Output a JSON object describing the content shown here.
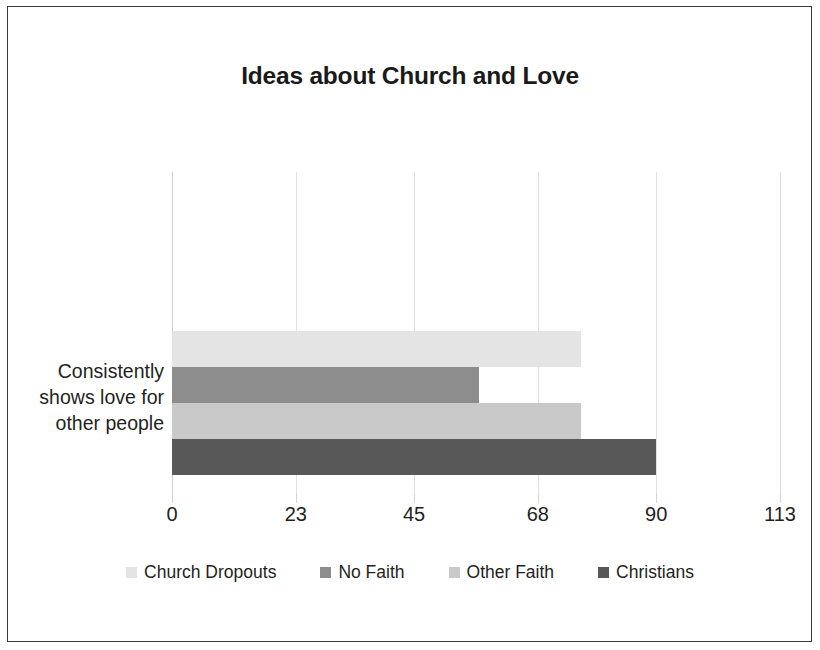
{
  "figure": {
    "title": "Ideas about Church and Love",
    "border_color": "#3a3a3c",
    "background": "#ffffff"
  },
  "chart_data": {
    "type": "bar",
    "orientation": "horizontal",
    "title": "Ideas about Church and Love",
    "xlabel": "",
    "ylabel": "",
    "categories": [
      "Consistently shows love for other people"
    ],
    "category_label_lines": [
      "Consistently",
      "shows love for",
      "other people"
    ],
    "series": [
      {
        "name": "Church Dropouts",
        "values": [
          76
        ],
        "color": "#e4e4e4"
      },
      {
        "name": "No Faith",
        "values": [
          57
        ],
        "color": "#8d8d8d"
      },
      {
        "name": "Other Faith",
        "values": [
          76
        ],
        "color": "#c9c9c9"
      },
      {
        "name": "Christians",
        "values": [
          90
        ],
        "color": "#585858"
      }
    ],
    "xlim": [
      0,
      113
    ],
    "xticks": [
      0,
      23,
      45,
      68,
      90,
      113
    ],
    "xtick_labels": [
      "0",
      "23",
      "45",
      "68",
      "90",
      "113"
    ],
    "grid": true,
    "grid_axis": "x",
    "grid_color": "#e0e0e0",
    "legend_position": "bottom"
  },
  "legend": {
    "items": [
      {
        "label": "Church Dropouts",
        "color": "#e4e4e4"
      },
      {
        "label": "No Faith",
        "color": "#8d8d8d"
      },
      {
        "label": "Other Faith",
        "color": "#c9c9c9"
      },
      {
        "label": "Christians",
        "color": "#585858"
      }
    ]
  }
}
